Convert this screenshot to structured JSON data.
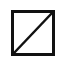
{
  "icon": {
    "name": "no-fill-swatch",
    "stroke_color": "#111111",
    "fill_color": "#ffffff"
  }
}
